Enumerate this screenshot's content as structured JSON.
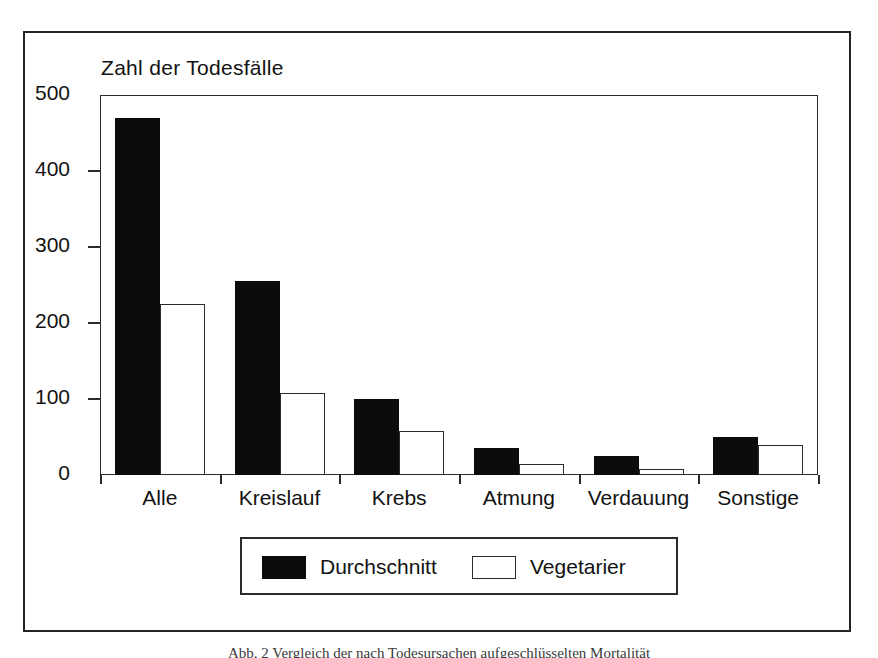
{
  "chart_data": {
    "type": "bar",
    "title": "Zahl der Todesfälle",
    "xlabel": "",
    "ylabel": "",
    "ylim": [
      0,
      500
    ],
    "yticks": [
      0,
      100,
      200,
      300,
      400,
      500
    ],
    "grid": false,
    "legend_position": "bottom",
    "categories": [
      "Alle",
      "Kreislauf",
      "Krebs",
      "Atmung",
      "Verdauung",
      "Sonstige"
    ],
    "series": [
      {
        "name": "Durchschnitt",
        "color": "#0c0c0c",
        "values": [
          470,
          255,
          100,
          35,
          25,
          50
        ]
      },
      {
        "name": "Vegetarier",
        "color": "#ffffff",
        "values": [
          225,
          108,
          58,
          15,
          8,
          40
        ]
      }
    ]
  },
  "figure": {
    "caption": "Abb. 2   Vergleich der nach Todesursachen aufgeschlüsselten Mortalität"
  },
  "axis": {
    "y_tick_labels": [
      "500",
      "400",
      "300",
      "200",
      "100",
      "0"
    ]
  },
  "legend": {
    "items": [
      {
        "label": "Durchschnitt",
        "swatch": "filled-black-swatch"
      },
      {
        "label": "Vegetarier",
        "swatch": "outlined-white-swatch"
      }
    ]
  }
}
